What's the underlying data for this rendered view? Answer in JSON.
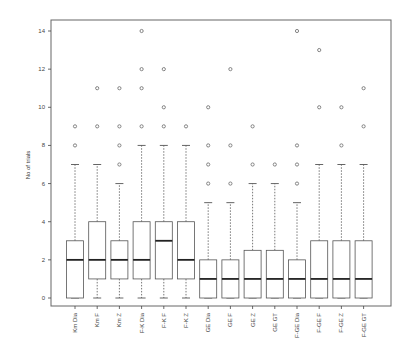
{
  "chart_data": {
    "type": "box",
    "title": "",
    "xlabel": "",
    "ylabel": "No of trials",
    "ylim": [
      0,
      14
    ],
    "yticks": [
      0,
      2,
      4,
      6,
      8,
      10,
      12,
      14
    ],
    "grid": false,
    "legend": null,
    "categories": [
      "Km Dia",
      "Km F",
      "Km Z",
      "F-K Dia",
      "F-K F",
      "F-K Z",
      "GE Dia",
      "GE F",
      "GE Z",
      "GE GT",
      "F-GE Dia",
      "F-GE F",
      "F-GE Z",
      "F-GE GT"
    ],
    "boxes": [
      {
        "label": "Km Dia",
        "whisker_low": 0,
        "q1": 0,
        "median": 2,
        "q3": 3,
        "whisker_high": 7,
        "outliers": [
          8,
          9
        ]
      },
      {
        "label": "Km F",
        "whisker_low": 0,
        "q1": 1,
        "median": 2,
        "q3": 4,
        "whisker_high": 7,
        "outliers": [
          9,
          11
        ]
      },
      {
        "label": "Km Z",
        "whisker_low": 0,
        "q1": 1,
        "median": 2,
        "q3": 3,
        "whisker_high": 6,
        "outliers": [
          7,
          8,
          9,
          11
        ]
      },
      {
        "label": "F-K Dia",
        "whisker_low": 0,
        "q1": 1,
        "median": 2,
        "q3": 4,
        "whisker_high": 8,
        "outliers": [
          9,
          11,
          12,
          14
        ]
      },
      {
        "label": "F-K F",
        "whisker_low": 0,
        "q1": 1,
        "median": 3,
        "q3": 4,
        "whisker_high": 8,
        "outliers": [
          9,
          10,
          12
        ]
      },
      {
        "label": "F-K Z",
        "whisker_low": 0,
        "q1": 1,
        "median": 2,
        "q3": 4,
        "whisker_high": 8,
        "outliers": [
          9
        ]
      },
      {
        "label": "GE Dia",
        "whisker_low": 0,
        "q1": 0,
        "median": 1,
        "q3": 2,
        "whisker_high": 5,
        "outliers": [
          6,
          7,
          8,
          10
        ]
      },
      {
        "label": "GE F",
        "whisker_low": 0,
        "q1": 0,
        "median": 1,
        "q3": 2,
        "whisker_high": 5,
        "outliers": [
          6,
          8,
          12
        ]
      },
      {
        "label": "GE Z",
        "whisker_low": 0,
        "q1": 0,
        "median": 1,
        "q3": 2.5,
        "whisker_high": 6,
        "outliers": [
          7,
          9
        ]
      },
      {
        "label": "GE GT",
        "whisker_low": 0,
        "q1": 0,
        "median": 1,
        "q3": 2.5,
        "whisker_high": 6,
        "outliers": [
          7
        ]
      },
      {
        "label": "F-GE Dia",
        "whisker_low": 0,
        "q1": 0,
        "median": 1,
        "q3": 2,
        "whisker_high": 5,
        "outliers": [
          6,
          7,
          8,
          14
        ]
      },
      {
        "label": "F-GE F",
        "whisker_low": 0,
        "q1": 0,
        "median": 1,
        "q3": 3,
        "whisker_high": 7,
        "outliers": [
          10,
          13
        ]
      },
      {
        "label": "F-GE Z",
        "whisker_low": 0,
        "q1": 0,
        "median": 1,
        "q3": 3,
        "whisker_high": 7,
        "outliers": [
          8,
          10
        ]
      },
      {
        "label": "F-GE GT",
        "whisker_low": 0,
        "q1": 0,
        "median": 1,
        "q3": 3,
        "whisker_high": 7,
        "outliers": [
          9,
          11
        ]
      }
    ],
    "colors": {
      "box_stroke": "#555555",
      "median": "#222222",
      "outlier": "#777777",
      "axis": "#444444"
    }
  }
}
